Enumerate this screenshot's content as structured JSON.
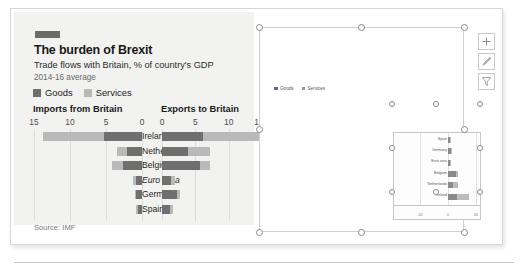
{
  "figure": {
    "brand_tag": "",
    "title": "The burden of Brexit",
    "subtitle": "Trade flows with Britain, % of country's GDP",
    "period": "2014-16 average",
    "source": "Source: IMF",
    "legend": [
      {
        "label": "Goods",
        "color": "#6f6f6f"
      },
      {
        "label": "Services",
        "color": "#b9b9b9"
      }
    ],
    "panels": {
      "left_heading": "Imports from Britain",
      "right_heading": "Exports to Britain"
    },
    "axis": {
      "left_ticks": [
        "15",
        "10",
        "5",
        "0"
      ],
      "right_ticks": [
        "0",
        "5",
        "10",
        "15"
      ],
      "max": 15
    }
  },
  "chart_data": {
    "type": "bar",
    "title": "The burden of Brexit",
    "subtitle": "Trade flows with Britain, % of country's GDP",
    "note": "2014-16 average",
    "source": "Source: IMF",
    "xlabel": "% of country's GDP",
    "ylabel": "",
    "orientation": "horizontal-diverging",
    "xlim": [
      0,
      15
    ],
    "grid": true,
    "legend_position": "top-left",
    "categories": [
      "Ireland",
      "Netherlands",
      "Belgium",
      "Euro area",
      "Germany",
      "Spain"
    ],
    "panels": [
      {
        "name": "Imports from Britain",
        "direction": "left",
        "series": [
          {
            "name": "Goods",
            "color": "#6f6f6f",
            "values": [
              5.3,
              2.1,
              2.7,
              0.9,
              0.8,
              0.6
            ]
          },
          {
            "name": "Services",
            "color": "#b9b9b9",
            "values": [
              8.4,
              1.4,
              1.4,
              0.3,
              0.2,
              0.2
            ]
          }
        ],
        "totals": [
          13.7,
          3.5,
          4.1,
          1.2,
          1.0,
          0.8
        ]
      },
      {
        "name": "Exports to Britain",
        "direction": "right",
        "series": [
          {
            "name": "Goods",
            "color": "#6f6f6f",
            "values": [
              6.2,
              3.9,
              5.7,
              1.4,
              2.3,
              1.2
            ]
          },
          {
            "name": "Services",
            "color": "#b9b9b9",
            "values": [
              8.6,
              3.3,
              1.5,
              0.6,
              0.4,
              0.4
            ]
          }
        ],
        "totals": [
          14.8,
          7.2,
          7.2,
          2.0,
          2.7,
          1.6
        ]
      }
    ]
  },
  "excel_chart": {
    "legend": [
      {
        "label": "Goods",
        "color": "#5b6b8c"
      },
      {
        "label": "Services",
        "color": "#9a9a9a"
      }
    ],
    "inner_chart": {
      "type": "bar",
      "orientation": "horizontal-stacked",
      "categories": [
        "Spain",
        "Germany",
        "Euro area",
        "Belgium",
        "Netherlands",
        "Ireland"
      ],
      "xticks": [
        "-20",
        "0",
        "20"
      ],
      "xlim": [
        -20,
        20
      ],
      "series": [
        {
          "name": "Goods",
          "color": "#8a8a8a",
          "values": [
            1.2,
            2.3,
            1.4,
            5.7,
            3.9,
            6.2
          ]
        },
        {
          "name": "Services",
          "color": "#bcbcbc",
          "values": [
            0.4,
            0.4,
            0.6,
            1.5,
            3.3,
            8.6
          ]
        }
      ]
    },
    "selected": true
  },
  "toolbar": {
    "buttons": [
      {
        "name": "chart-elements",
        "icon": "plus-icon",
        "label": "Chart Elements"
      },
      {
        "name": "chart-styles",
        "icon": "paintbrush-icon",
        "label": "Chart Styles"
      },
      {
        "name": "chart-filters",
        "icon": "funnel-icon",
        "label": "Chart Filters"
      }
    ]
  }
}
